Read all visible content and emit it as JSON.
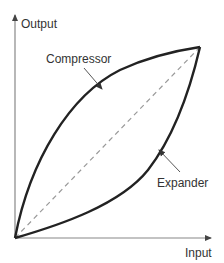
{
  "diagram": {
    "axes": {
      "x_label": "Input",
      "y_label": "Output",
      "origin": [
        15,
        238
      ],
      "x_end": [
        212,
        238
      ],
      "y_end": [
        15,
        14
      ],
      "axis_color": "#888888"
    },
    "curves": [
      {
        "name": "Compressor",
        "shape": "concave",
        "from": [
          15,
          238
        ],
        "to": [
          200,
          47
        ],
        "color": "#222222"
      },
      {
        "name": "Expander",
        "shape": "convex",
        "from": [
          15,
          238
        ],
        "to": [
          200,
          47
        ],
        "color": "#222222"
      },
      {
        "name": "Linear",
        "style": "dashed",
        "from": [
          15,
          238
        ],
        "to": [
          200,
          47
        ],
        "color": "#999999"
      }
    ],
    "annotations": {
      "compressor_label": "Compressor",
      "expander_label": "Expander"
    }
  }
}
